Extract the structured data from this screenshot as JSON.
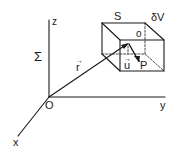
{
  "diagram": {
    "labels": {
      "z": "z",
      "y": "y",
      "x": "x",
      "origin": "O",
      "frame": "Σ",
      "surface": "S",
      "volume": "δV",
      "center": "o",
      "position_vector": "r",
      "unit_vector": "u",
      "point": "P",
      "vector_arrow": "→"
    },
    "colors": {
      "ink": "#1a1a1a",
      "background": "#ffffff"
    }
  }
}
